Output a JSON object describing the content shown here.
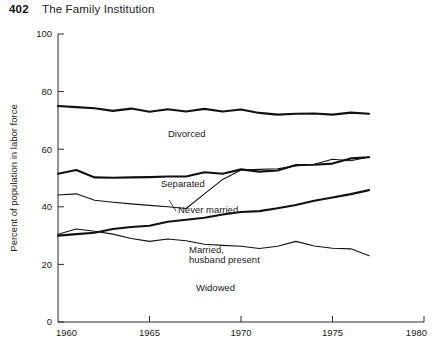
{
  "header": {
    "page_number": "402",
    "running_head": "The Family Institution"
  },
  "chart_data": {
    "type": "line",
    "title": "",
    "xlabel": "",
    "ylabel": "Percent of population in labor force",
    "xlim": [
      1960,
      1980
    ],
    "ylim": [
      0,
      100
    ],
    "grid": false,
    "legend_position": "inline-labels",
    "x_ticks": [
      "1960",
      "1965",
      "1970",
      "1975",
      "1980"
    ],
    "x_tick_values": [
      1960,
      1965,
      1970,
      1975,
      1980
    ],
    "y_ticks": [
      "0",
      "20",
      "40",
      "60",
      "80",
      "100"
    ],
    "y_tick_values": [
      0,
      20,
      40,
      60,
      80,
      100
    ],
    "series": [
      {
        "name": "Divorced",
        "label": "Divorced",
        "stroke_width": 2.1,
        "x": [
          1960,
          1961,
          1962,
          1963,
          1964,
          1965,
          1966,
          1967,
          1968,
          1969,
          1970,
          1971,
          1972,
          1973,
          1974,
          1975,
          1976,
          1977
        ],
        "values": [
          75.0,
          74.6,
          74.2,
          73.3,
          74.1,
          73.0,
          73.9,
          73.1,
          74.0,
          73.1,
          73.8,
          72.6,
          72.0,
          72.3,
          72.4,
          72.0,
          72.7,
          72.3
        ]
      },
      {
        "name": "Separated",
        "label": "Separated",
        "stroke_width": 2.1,
        "x": [
          1960,
          1961,
          1962,
          1963,
          1964,
          1965,
          1966,
          1967,
          1968,
          1969,
          1970,
          1971,
          1972,
          1973,
          1974,
          1975,
          1976,
          1977
        ],
        "values": [
          51.5,
          52.8,
          50.2,
          50.1,
          50.2,
          50.3,
          50.5,
          50.5,
          52.0,
          51.5,
          53.0,
          52.2,
          52.6,
          54.5,
          54.6,
          55.0,
          56.8,
          57.2
        ]
      },
      {
        "name": "Never married",
        "label": "Never married",
        "stroke_width": 1.1,
        "x": [
          1960,
          1961,
          1962,
          1963,
          1964,
          1965,
          1966,
          1967,
          1968,
          1969,
          1970,
          1971,
          1972,
          1973,
          1974,
          1975,
          1976,
          1977
        ],
        "values": [
          44.1,
          44.5,
          42.3,
          41.6,
          41.0,
          40.5,
          40.0,
          39.4,
          44.5,
          49.5,
          52.8,
          53.0,
          53.2,
          54.2,
          54.8,
          56.5,
          56.0,
          57.3
        ]
      },
      {
        "name": "Married, husband present",
        "label": "Married,\nhusband present",
        "label_line_1": "Married,",
        "label_line_2": "husband present",
        "stroke_width": 2.1,
        "x": [
          1960,
          1961,
          1962,
          1963,
          1964,
          1965,
          1966,
          1967,
          1968,
          1969,
          1970,
          1971,
          1972,
          1973,
          1974,
          1975,
          1976,
          1977
        ],
        "values": [
          30.0,
          30.5,
          31.0,
          32.3,
          33.0,
          33.4,
          34.8,
          35.5,
          36.2,
          37.3,
          38.2,
          38.5,
          39.5,
          40.6,
          42.1,
          43.2,
          44.4,
          45.8
        ]
      },
      {
        "name": "Widowed",
        "label": "Widowed",
        "stroke_width": 1.1,
        "x": [
          1960,
          1961,
          1962,
          1963,
          1964,
          1965,
          1966,
          1967,
          1968,
          1969,
          1970,
          1971,
          1972,
          1973,
          1974,
          1975,
          1976,
          1977
        ],
        "values": [
          30.5,
          32.3,
          31.5,
          30.5,
          29.0,
          28.0,
          28.8,
          28.2,
          27.0,
          26.6,
          26.3,
          25.5,
          26.3,
          28.0,
          26.4,
          25.6,
          25.4,
          23.0
        ]
      }
    ]
  }
}
